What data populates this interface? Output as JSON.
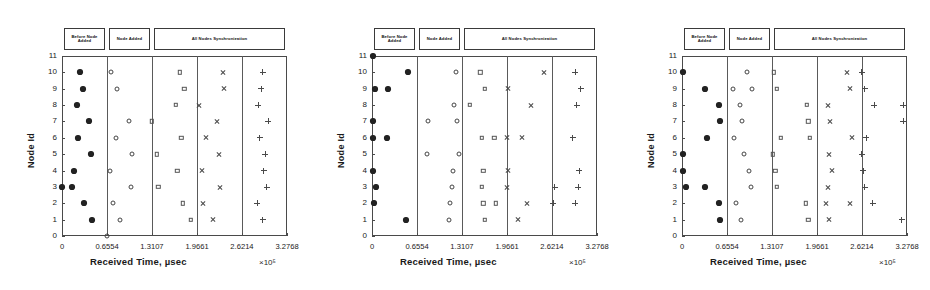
{
  "figure": {
    "panel_count": 3,
    "axis": {
      "ylabel": "Node Id",
      "xlabel": "Received Time, µsec",
      "exponent": "×10⁵",
      "yticks": [
        "0",
        "1",
        "2",
        "3",
        "4",
        "5",
        "6",
        "7",
        "8",
        "9",
        "10",
        "11"
      ],
      "xticks": [
        "0",
        "0.6554",
        "1.3107",
        "1.9661",
        "2.6214",
        "3.2768"
      ],
      "ylim": [
        0,
        11
      ],
      "xlim": [
        0,
        3.2768
      ]
    },
    "annotations": [
      {
        "label": "Before Node Added",
        "x_start": 0.0,
        "x_end": 0.6554
      },
      {
        "label": "Node Added",
        "x_start": 0.6554,
        "x_end": 1.3107
      },
      {
        "label": "All Nodes Synchronization",
        "x_start": 1.3107,
        "x_end": 3.2768
      }
    ],
    "dividers": [
      0.6554,
      1.3107,
      1.9661,
      2.6214
    ],
    "colors": {
      "axis": "#4a4a4a",
      "marker_filled": "#222222",
      "marker_open": "#4a4a4a",
      "box_border": "#3a3a3a",
      "background": "#ffffff"
    }
  },
  "chart_data": [
    {
      "type": "scatter",
      "title": "",
      "xlabel": "Received Time, µsec",
      "ylabel": "Node Id",
      "xlim": [
        0,
        3.2768
      ],
      "ylim": [
        0,
        11
      ],
      "x_scale": "×10⁵",
      "grid": false,
      "legend": "none",
      "series": [
        {
          "name": "Before Node Added",
          "marker": "star",
          "points": [
            [
              0.0,
              3
            ],
            [
              0.26,
              10
            ],
            [
              0.3,
              9
            ],
            [
              0.22,
              8
            ],
            [
              0.4,
              7
            ],
            [
              0.24,
              6
            ],
            [
              0.42,
              5
            ],
            [
              0.18,
              4
            ],
            [
              0.14,
              3
            ],
            [
              0.32,
              2
            ],
            [
              0.44,
              1
            ]
          ]
        },
        {
          "name": "Node Added",
          "marker": "circle",
          "points": [
            [
              0.72,
              10
            ],
            [
              0.8,
              9
            ],
            [
              0.98,
              7
            ],
            [
              0.78,
              6
            ],
            [
              1.02,
              5
            ],
            [
              0.7,
              4
            ],
            [
              1.0,
              3
            ],
            [
              0.74,
              2
            ],
            [
              0.84,
              1
            ],
            [
              0.66,
              0
            ]
          ]
        },
        {
          "name": "Sync Zone 1",
          "marker": "square",
          "points": [
            [
              1.72,
              10
            ],
            [
              1.78,
              9
            ],
            [
              1.66,
              8
            ],
            [
              1.31,
              7
            ],
            [
              1.74,
              6
            ],
            [
              1.38,
              5
            ],
            [
              1.68,
              4
            ],
            [
              1.4,
              3
            ],
            [
              1.76,
              2
            ],
            [
              1.88,
              1
            ]
          ]
        },
        {
          "name": "Sync Zone 2",
          "marker": "cross",
          "points": [
            [
              2.34,
              10
            ],
            [
              2.36,
              9
            ],
            [
              2.0,
              8
            ],
            [
              2.26,
              7
            ],
            [
              2.1,
              6
            ],
            [
              2.28,
              5
            ],
            [
              2.04,
              4
            ],
            [
              2.3,
              3
            ],
            [
              2.06,
              2
            ],
            [
              2.2,
              1
            ]
          ]
        },
        {
          "name": "Sync Zone 3",
          "marker": "plus",
          "points": [
            [
              2.92,
              10
            ],
            [
              2.9,
              9
            ],
            [
              2.86,
              8
            ],
            [
              3.0,
              7
            ],
            [
              2.88,
              6
            ],
            [
              2.96,
              5
            ],
            [
              2.94,
              4
            ],
            [
              2.98,
              3
            ],
            [
              2.84,
              2
            ],
            [
              2.92,
              1
            ]
          ]
        }
      ]
    },
    {
      "type": "scatter",
      "title": "",
      "xlabel": "Received Time, µsec",
      "ylabel": "Node Id",
      "xlim": [
        0,
        3.2768
      ],
      "ylim": [
        0,
        11
      ],
      "x_scale": "×10⁵",
      "grid": false,
      "legend": "none",
      "series": [
        {
          "name": "Before Node Added",
          "marker": "star",
          "points": [
            [
              0.02,
              11
            ],
            [
              0.52,
              10
            ],
            [
              0.04,
              9
            ],
            [
              0.24,
              9
            ],
            [
              0.01,
              7
            ],
            [
              0.02,
              6
            ],
            [
              0.22,
              6
            ],
            [
              0.02,
              4
            ],
            [
              0.06,
              3
            ],
            [
              0.03,
              2
            ],
            [
              0.5,
              1
            ]
          ]
        },
        {
          "name": "Node Added",
          "marker": "circle",
          "points": [
            [
              1.22,
              10
            ],
            [
              0.82,
              7
            ],
            [
              1.24,
              7
            ],
            [
              1.2,
              8
            ],
            [
              0.8,
              5
            ],
            [
              1.26,
              5
            ],
            [
              1.18,
              4
            ],
            [
              1.16,
              3
            ],
            [
              1.14,
              2
            ],
            [
              1.12,
              1
            ]
          ]
        },
        {
          "name": "Sync Zone 1",
          "marker": "square",
          "points": [
            [
              1.58,
              10
            ],
            [
              1.64,
              9
            ],
            [
              1.42,
              8
            ],
            [
              1.6,
              6
            ],
            [
              1.78,
              6
            ],
            [
              1.62,
              4
            ],
            [
              1.6,
              3
            ],
            [
              1.62,
              2
            ],
            [
              1.8,
              2
            ],
            [
              1.64,
              1
            ]
          ]
        },
        {
          "name": "Sync Zone 2",
          "marker": "cross",
          "points": [
            [
              2.5,
              10
            ],
            [
              1.98,
              9
            ],
            [
              2.32,
              8
            ],
            [
              1.96,
              6
            ],
            [
              2.18,
              6
            ],
            [
              1.98,
              4
            ],
            [
              1.96,
              3
            ],
            [
              2.26,
              2
            ],
            [
              2.12,
              1
            ]
          ]
        },
        {
          "name": "Sync Zone 3",
          "marker": "plus",
          "points": [
            [
              2.96,
              10
            ],
            [
              3.04,
              9
            ],
            [
              2.98,
              8
            ],
            [
              2.92,
              6
            ],
            [
              3.02,
              4
            ],
            [
              3.0,
              3
            ],
            [
              2.66,
              3
            ],
            [
              2.96,
              2
            ],
            [
              2.64,
              2
            ]
          ]
        }
      ]
    },
    {
      "type": "scatter",
      "title": "",
      "xlabel": "Received Time, µsec",
      "ylabel": "Node Id",
      "xlim": [
        0,
        3.2768
      ],
      "ylim": [
        0,
        11
      ],
      "x_scale": "×10⁵",
      "grid": false,
      "legend": "none",
      "series": [
        {
          "name": "Before Node Added",
          "marker": "star",
          "points": [
            [
              0.02,
              10
            ],
            [
              0.34,
              9
            ],
            [
              0.54,
              8
            ],
            [
              0.56,
              7
            ],
            [
              0.36,
              6
            ],
            [
              0.01,
              5
            ],
            [
              0.02,
              4
            ],
            [
              0.06,
              3
            ],
            [
              0.34,
              3
            ],
            [
              0.54,
              2
            ],
            [
              0.56,
              1
            ]
          ]
        },
        {
          "name": "Node Added",
          "marker": "circle",
          "points": [
            [
              0.94,
              10
            ],
            [
              0.74,
              9
            ],
            [
              1.02,
              9
            ],
            [
              0.84,
              8
            ],
            [
              0.88,
              7
            ],
            [
              0.76,
              6
            ],
            [
              0.9,
              5
            ],
            [
              0.98,
              4
            ],
            [
              1.0,
              3
            ],
            [
              0.78,
              2
            ],
            [
              0.86,
              1
            ]
          ]
        },
        {
          "name": "Sync Zone 1",
          "marker": "square",
          "points": [
            [
              1.34,
              10
            ],
            [
              1.38,
              9
            ],
            [
              1.82,
              8
            ],
            [
              1.84,
              7
            ],
            [
              1.44,
              6
            ],
            [
              1.86,
              6
            ],
            [
              1.32,
              5
            ],
            [
              1.36,
              4
            ],
            [
              1.38,
              3
            ],
            [
              1.8,
              2
            ],
            [
              1.84,
              1
            ]
          ]
        },
        {
          "name": "Sync Zone 2",
          "marker": "cross",
          "points": [
            [
              2.4,
              10
            ],
            [
              2.44,
              9
            ],
            [
              2.12,
              8
            ],
            [
              2.16,
              7
            ],
            [
              2.48,
              6
            ],
            [
              2.14,
              5
            ],
            [
              2.18,
              4
            ],
            [
              2.12,
              3
            ],
            [
              2.1,
              2
            ],
            [
              2.44,
              2
            ],
            [
              2.14,
              1
            ]
          ]
        },
        {
          "name": "Sync Zone 3",
          "marker": "plus",
          "points": [
            [
              2.62,
              10
            ],
            [
              2.66,
              9
            ],
            [
              2.8,
              8
            ],
            [
              3.22,
              8
            ],
            [
              2.68,
              6
            ],
            [
              2.62,
              5
            ],
            [
              2.64,
              4
            ],
            [
              2.66,
              3
            ],
            [
              2.78,
              2
            ],
            [
              3.2,
              1
            ],
            [
              3.22,
              7
            ]
          ]
        }
      ]
    }
  ]
}
